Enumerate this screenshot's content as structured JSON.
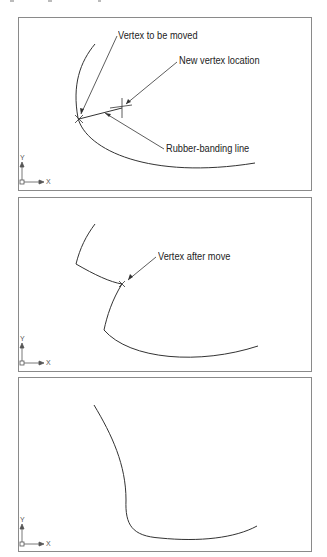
{
  "panels": [
    {
      "name": "before-move",
      "labels": {
        "vertex_to_move": "Vertex to be moved",
        "new_location": "New vertex location",
        "rubber_band": "Rubber-banding line"
      }
    },
    {
      "name": "during-move",
      "labels": {
        "vertex_after": "Vertex after move"
      }
    },
    {
      "name": "after-regen",
      "labels": {}
    }
  ],
  "ucs_icon": {
    "x_label": "X",
    "y_label": "Y"
  },
  "colors": {
    "line": "#333333",
    "frame": "#8a8a8a"
  }
}
